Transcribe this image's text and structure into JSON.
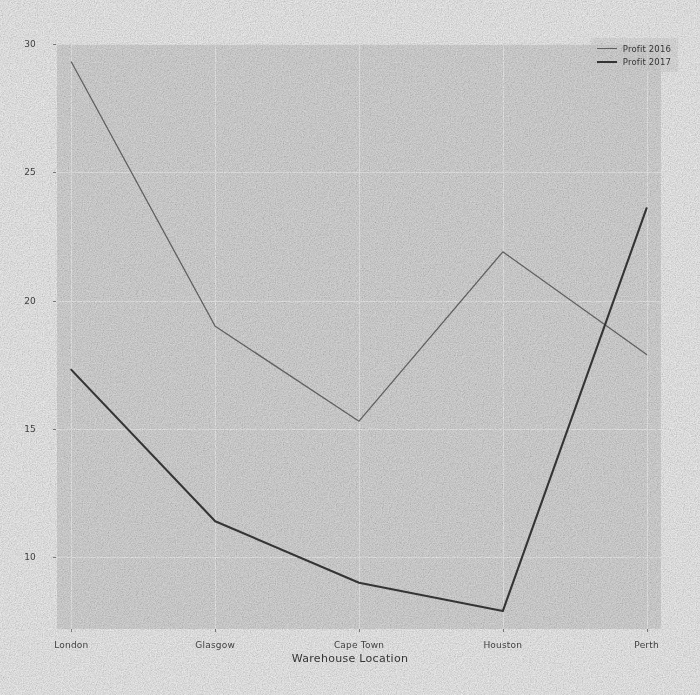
{
  "chart_data": {
    "type": "line",
    "title": "",
    "xlabel": "Warehouse Location",
    "ylabel": "",
    "categories": [
      "London",
      "Glasgow",
      "Cape Town",
      "Houston",
      "Perth"
    ],
    "series": [
      {
        "name": "Profit 2016",
        "color": "#6f6f6f",
        "linewidth": 1.3,
        "values": [
          29.3,
          19.0,
          15.3,
          21.9,
          17.9
        ]
      },
      {
        "name": "Profit 2017",
        "color": "#3c3c3c",
        "linewidth": 2.1,
        "values": [
          17.3,
          11.4,
          9.0,
          7.9,
          23.6
        ]
      }
    ],
    "yticks": [
      10,
      15,
      20,
      25,
      30
    ],
    "ytick_labels": [
      "10",
      "15",
      "20",
      "25",
      "30"
    ],
    "xtick_labels": [
      "London",
      "Glasgow",
      "Cape Town",
      "Houston",
      "Perth"
    ],
    "ylim": [
      7.2,
      30.0
    ],
    "xlim": [
      -0.1,
      4.1
    ],
    "grid": true,
    "grid_color": "#f7f7f7",
    "plot_background": "#e3e3e3",
    "figure_background": "#fbfbfb",
    "legend": {
      "position": "upper right",
      "entries": [
        "Profit 2016",
        "Profit 2017"
      ]
    }
  }
}
